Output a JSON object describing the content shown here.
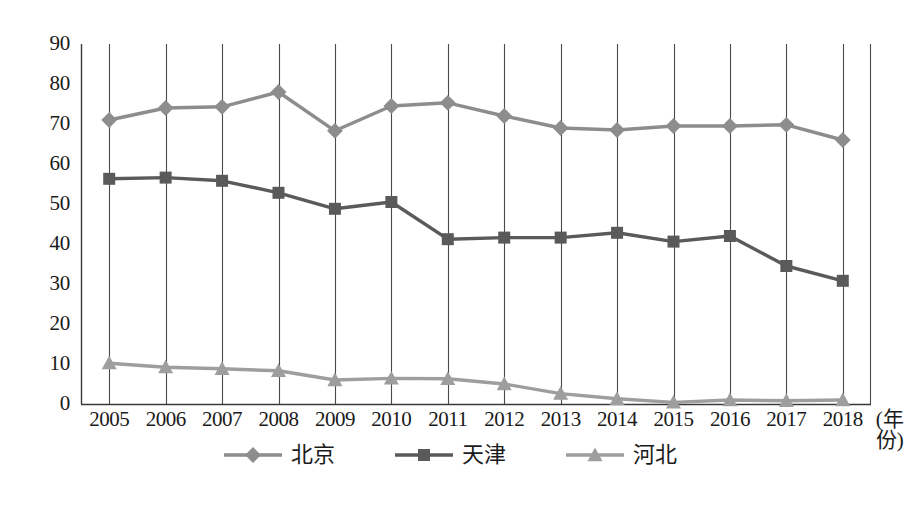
{
  "chart_data": {
    "type": "line",
    "title": "",
    "xlabel": "(年份)",
    "ylabel": "",
    "x": [
      2005,
      2006,
      2007,
      2008,
      2009,
      2010,
      2011,
      2012,
      2013,
      2014,
      2015,
      2016,
      2017,
      2018
    ],
    "categories": [
      "2005",
      "2006",
      "2007",
      "2008",
      "2009",
      "2010",
      "2011",
      "2012",
      "2013",
      "2014",
      "2015",
      "2016",
      "2017",
      "2018"
    ],
    "ylim": [
      0,
      90
    ],
    "yticks": [
      0,
      10,
      20,
      30,
      40,
      50,
      60,
      70,
      80,
      90
    ],
    "ytick_labels": [
      "0",
      "10",
      "20",
      "30",
      "40",
      "50",
      "60",
      "70",
      "80",
      "90"
    ],
    "grid": "vertical",
    "legend_position": "bottom-center",
    "series": [
      {
        "name": "北京",
        "marker": "diamond",
        "color": "#8d8d8d",
        "values": [
          71,
          74,
          74.3,
          78,
          68.3,
          74.5,
          75.3,
          72,
          69,
          68.5,
          69.5,
          69.5,
          69.8,
          66
        ]
      },
      {
        "name": "天津",
        "marker": "square",
        "color": "#5a5a5a",
        "values": [
          56.3,
          56.6,
          55.8,
          52.8,
          48.8,
          50.5,
          41.2,
          41.6,
          41.6,
          42.8,
          40.6,
          42,
          34.5,
          30.8
        ]
      },
      {
        "name": "河北",
        "marker": "triangle",
        "color": "#9e9e9e",
        "values": [
          10.2,
          9.2,
          8.8,
          8.3,
          6,
          6.4,
          6.3,
          5,
          2.6,
          1.3,
          0.4,
          1,
          0.8,
          1
        ]
      }
    ]
  },
  "legend": {
    "items": [
      {
        "label": "北京",
        "marker": "diamond",
        "color": "#8d8d8d"
      },
      {
        "label": "天津",
        "marker": "square",
        "color": "#5a5a5a"
      },
      {
        "label": "河北",
        "marker": "triangle",
        "color": "#9e9e9e"
      }
    ]
  },
  "axes": {
    "x_unit_label": "(年份)"
  }
}
